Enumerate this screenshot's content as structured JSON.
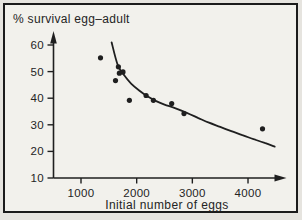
{
  "chart_data": {
    "type": "scatter",
    "title": "% survival egg–adult",
    "xlabel": "Initial number of eggs",
    "ylabel": "% survival egg–adult",
    "x_ticks": [
      1000,
      2000,
      3000,
      4000
    ],
    "y_ticks": [
      10,
      20,
      30,
      40,
      50,
      60
    ],
    "xlim": [
      500,
      4600
    ],
    "ylim": [
      10,
      63
    ],
    "grid": false,
    "legend": null,
    "points": [
      [
        1350,
        55.2
      ],
      [
        1672,
        51.8
      ],
      [
        1690,
        49.4
      ],
      [
        1755,
        49.9
      ],
      [
        1620,
        46.6
      ],
      [
        1870,
        39.2
      ],
      [
        2170,
        41.0
      ],
      [
        2300,
        39.2
      ],
      [
        2630,
        38.0
      ],
      [
        2850,
        34.2
      ],
      [
        4260,
        28.5
      ]
    ],
    "fitted_curve": [
      [
        1550,
        61.0
      ],
      [
        1660,
        52.5
      ],
      [
        1780,
        48.5
      ],
      [
        1900,
        45.5
      ],
      [
        2050,
        42.8
      ],
      [
        2200,
        40.6
      ],
      [
        2350,
        38.9
      ],
      [
        2500,
        37.6
      ],
      [
        2700,
        36.2
      ],
      [
        2900,
        34.5
      ],
      [
        3100,
        32.6
      ],
      [
        3300,
        30.8
      ],
      [
        3500,
        29.2
      ],
      [
        3700,
        27.6
      ],
      [
        3900,
        26.1
      ],
      [
        4100,
        24.6
      ],
      [
        4300,
        23.2
      ],
      [
        4480,
        21.8
      ]
    ],
    "colors": {
      "ink": "#1f1f1f",
      "text": "#242424",
      "figure_bg": "#e6e4df",
      "plot_bg": "#f2f1ec"
    }
  }
}
